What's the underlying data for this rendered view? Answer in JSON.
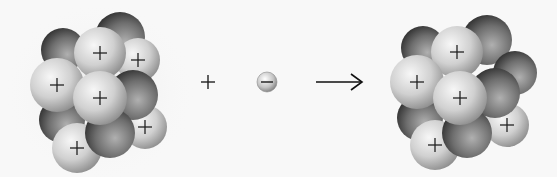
{
  "diagram": {
    "type": "electron-capture",
    "background": "#f8f8f8",
    "reactant_nucleus": {
      "label": "nucleus-before",
      "particles": [
        {
          "kind": "neutron",
          "cx": 63,
          "cy": 50,
          "r": 22
        },
        {
          "kind": "neutron",
          "cx": 120,
          "cy": 37,
          "r": 25
        },
        {
          "kind": "proton",
          "cx": 138,
          "cy": 60,
          "r": 22
        },
        {
          "kind": "proton",
          "cx": 100,
          "cy": 53,
          "r": 26
        },
        {
          "kind": "neutron",
          "cx": 62,
          "cy": 120,
          "r": 23
        },
        {
          "kind": "proton",
          "cx": 145,
          "cy": 127,
          "r": 22
        },
        {
          "kind": "proton",
          "cx": 57,
          "cy": 85,
          "r": 27
        },
        {
          "kind": "neutron",
          "cx": 133,
          "cy": 95,
          "r": 25
        },
        {
          "kind": "proton",
          "cx": 77,
          "cy": 148,
          "r": 25
        },
        {
          "kind": "neutron",
          "cx": 110,
          "cy": 133,
          "r": 25
        },
        {
          "kind": "proton",
          "cx": 100,
          "cy": 98,
          "r": 27
        }
      ],
      "proton_count": 6,
      "neutron_count": 5
    },
    "plus_operator": {
      "symbol": "+",
      "cx": 208,
      "cy": 82
    },
    "electron": {
      "symbol": "−",
      "cx": 267,
      "cy": 82,
      "r": 10
    },
    "reaction_arrow": {
      "symbol": "→",
      "x1": 316,
      "x2": 362,
      "y": 82
    },
    "product_nucleus": {
      "label": "nucleus-after",
      "particles": [
        {
          "kind": "neutron",
          "cx": 423,
          "cy": 48,
          "r": 22
        },
        {
          "kind": "neutron",
          "cx": 487,
          "cy": 40,
          "r": 25
        },
        {
          "kind": "neutron",
          "cx": 515,
          "cy": 73,
          "r": 22
        },
        {
          "kind": "proton",
          "cx": 457,
          "cy": 52,
          "r": 26
        },
        {
          "kind": "neutron",
          "cx": 420,
          "cy": 118,
          "r": 23
        },
        {
          "kind": "proton",
          "cx": 507,
          "cy": 125,
          "r": 22
        },
        {
          "kind": "proton",
          "cx": 417,
          "cy": 82,
          "r": 27
        },
        {
          "kind": "neutron",
          "cx": 495,
          "cy": 93,
          "r": 25
        },
        {
          "kind": "proton",
          "cx": 435,
          "cy": 145,
          "r": 25
        },
        {
          "kind": "neutron",
          "cx": 467,
          "cy": 133,
          "r": 25
        },
        {
          "kind": "proton",
          "cx": 460,
          "cy": 98,
          "r": 27
        }
      ],
      "proton_count": 5,
      "neutron_count": 6
    },
    "colors": {
      "proton_light": "#f2f2f2",
      "proton_mid": "#c8c8c8",
      "proton_dark": "#8a8a8a",
      "neutron_light": "#a8a8a8",
      "neutron_mid": "#6a6a6a",
      "neutron_dark": "#2e2e2e",
      "stroke": "#222222"
    }
  }
}
